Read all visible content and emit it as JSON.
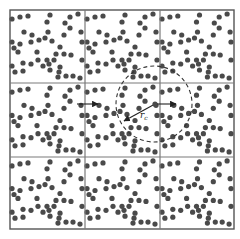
{
  "diagram": {
    "type": "periodic-boundary-conditions",
    "box": {
      "x": 10,
      "y": 10,
      "width": 224,
      "height": 219
    },
    "grid": {
      "rows": 3,
      "cols": 3,
      "vlines": [
        10,
        85,
        160,
        234
      ],
      "hlines": [
        10,
        83,
        157,
        229
      ]
    },
    "colors": {
      "grid": "#7a7a7a",
      "particle": "#4a4a4a",
      "circle": "#333333",
      "arrow": "#222222"
    },
    "particle_radius": 2.6,
    "cell_particles": [
      [
        2,
        9
      ],
      [
        10,
        7
      ],
      [
        18,
        6
      ],
      [
        40,
        5
      ],
      [
        60,
        7
      ],
      [
        68,
        4
      ],
      [
        37,
        12
      ],
      [
        55,
        13
      ],
      [
        60,
        18
      ],
      [
        14,
        22
      ],
      [
        22,
        25
      ],
      [
        38,
        22
      ],
      [
        54,
        25
      ],
      [
        71,
        22
      ],
      [
        2,
        32
      ],
      [
        10,
        34
      ],
      [
        21,
        32
      ],
      [
        29,
        30
      ],
      [
        35,
        28
      ],
      [
        42,
        31
      ],
      [
        72,
        32
      ],
      [
        4,
        38
      ],
      [
        8,
        42
      ],
      [
        27,
        42
      ],
      [
        50,
        37
      ],
      [
        46,
        44
      ],
      [
        54,
        44
      ],
      [
        61,
        45
      ],
      [
        28,
        50
      ],
      [
        37,
        50
      ],
      [
        44,
        50
      ],
      [
        72,
        50
      ],
      [
        2,
        56
      ],
      [
        13,
        53
      ],
      [
        21,
        54
      ],
      [
        33,
        56
      ],
      [
        39,
        54
      ],
      [
        50,
        57
      ],
      [
        5,
        62
      ],
      [
        13,
        61
      ],
      [
        40,
        60
      ],
      [
        49,
        62
      ],
      [
        48,
        67
      ],
      [
        56,
        66
      ],
      [
        63,
        66
      ],
      [
        70,
        68
      ]
    ],
    "cutoff_circle": {
      "cx": 154,
      "cy": 104,
      "r": 38
    },
    "arrows": [
      {
        "name": "image-displacement-arrow",
        "x1": 77,
        "y1": 104,
        "x2": 98,
        "y2": 104
      },
      {
        "name": "central-displacement-arrow",
        "x1": 155,
        "y1": 104,
        "x2": 176,
        "y2": 104
      },
      {
        "name": "cutoff-radius-arrow",
        "x1": 155,
        "y1": 104,
        "x2": 124,
        "y2": 121
      }
    ],
    "labels": {
      "radius_symbol": "r",
      "radius_subscript": "c",
      "radius_label_pos": {
        "x": 140,
        "y": 118
      }
    }
  }
}
